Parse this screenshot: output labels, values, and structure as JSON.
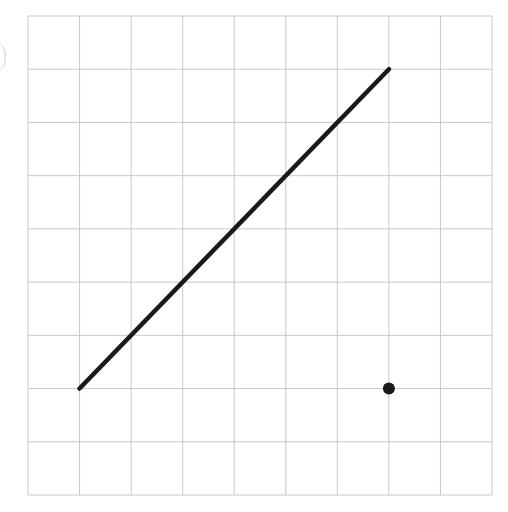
{
  "diagram": {
    "type": "coordinate-grid",
    "grid": {
      "columns": 9,
      "rows": 9,
      "left_px": 28,
      "top_px": 16,
      "right_px": 492,
      "bottom_px": 495,
      "line_color": "#c8c8c8",
      "line_width": 1
    },
    "segment": {
      "from": [
        1,
        2
      ],
      "to": [
        7,
        8
      ],
      "color": "#1a1a1a",
      "width": 4.5
    },
    "point": {
      "at": [
        7,
        2
      ],
      "radius": 6,
      "color": "#1a1a1a"
    }
  },
  "chart_data": {
    "type": "line",
    "title": "",
    "xlabel": "",
    "ylabel": "",
    "xlim": [
      0,
      9
    ],
    "ylim": [
      0,
      9
    ],
    "grid": true,
    "legend": null,
    "series": [
      {
        "name": "segment",
        "x": [
          1,
          7
        ],
        "y": [
          2,
          8
        ]
      },
      {
        "name": "point",
        "type": "scatter",
        "x": [
          7
        ],
        "y": [
          2
        ]
      }
    ]
  }
}
